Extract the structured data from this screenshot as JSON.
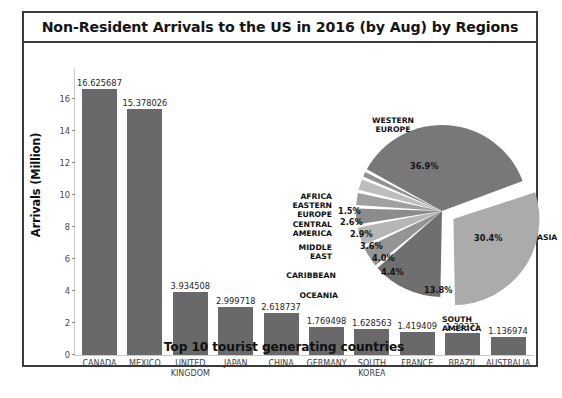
{
  "figure": {
    "title": "Non-Resident Arrivals to the US in 2016 (by Aug) by Regions",
    "border_color": "#3b3b3b",
    "background": "#ffffff"
  },
  "chart_data": [
    {
      "type": "bar",
      "title": "Non-Resident Arrivals to the US in 2016 (by Aug) by Regions",
      "xlabel": "Top 10 tourist generating countries",
      "ylabel": "Arrivals (Million)",
      "ylim": [
        0,
        17
      ],
      "yticks": [
        0,
        2,
        4,
        6,
        8,
        10,
        12,
        14,
        16
      ],
      "ytick_labels": [
        "0",
        "2",
        "4",
        "6",
        "8",
        "10",
        "12",
        "14",
        "16"
      ],
      "grid": false,
      "bar_color": "#696969",
      "categories": [
        "CANADA",
        "MEXICO",
        "UNITED\nKINGDOM",
        "JAPAN",
        "CHINA",
        "GERMANY",
        "SOUTH\nKOREA",
        "FRANCE",
        "BRAZIL",
        "AUSTRALIA"
      ],
      "values": [
        16.625687,
        15.378026,
        3.934508,
        2.999718,
        2.618737,
        1.769498,
        1.628563,
        1.419409,
        1.39371,
        1.136974
      ],
      "value_labels": [
        "16.625687",
        "15.378026",
        "3.934508",
        "2.999718",
        "2.618737",
        "1.769498",
        "1.628563",
        "1.419409",
        "1.39371",
        "1.136974"
      ]
    },
    {
      "type": "pie",
      "title": "",
      "legend": "none",
      "labels": [
        "WESTERN\nEUROPE",
        "ASIA",
        "SOUTH\nAMERICA",
        "OCEANIA",
        "CARIBBEAN",
        "MIDDLE\nEAST",
        "CENTRAL\nAMERICA",
        "EASTERN\nEUROPE",
        "AFRICA"
      ],
      "values": [
        36.9,
        30.4,
        13.8,
        4.4,
        4.0,
        3.6,
        2.9,
        2.6,
        1.5
      ],
      "pct_labels": [
        "36.9%",
        "30.4%",
        "13.8%",
        "4.4%",
        "4.0%",
        "3.6%",
        "2.9%",
        "2.6%",
        "1.5%"
      ],
      "colors": [
        "#787878",
        "#ababab",
        "#6f6f6f",
        "#949494",
        "#b6b6b6",
        "#8c8c8c",
        "#a0a0a0",
        "#bdbdbd",
        "#909090"
      ],
      "exploded": [
        "ASIA"
      ]
    }
  ]
}
